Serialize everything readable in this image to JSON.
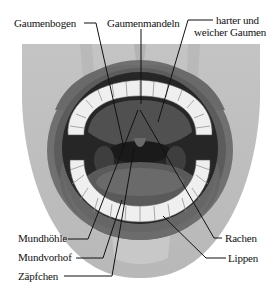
{
  "figure": {
    "colors": {
      "background": "#ffffff",
      "face": "#bdbdbd",
      "lips": "#6e6e6e",
      "lips_inner": "#5a5a5a",
      "cavity": "#2a2a2a",
      "teeth": "#f2f2f2",
      "tongue": "#5e5e5e",
      "line": "#111111"
    }
  },
  "labels": {
    "gaumenbogen": "Gaumenbogen",
    "gaumenmandeln": "Gaumenmandeln",
    "gaumen_line1": "harter und",
    "gaumen_line2": "weicher Gaumen",
    "mundhoehle": "Mundhöhle",
    "mundvorhof": "Mundvorhof",
    "zaepfchen": "Zäpfchen",
    "rachen": "Rachen",
    "lippen": "Lippen"
  }
}
